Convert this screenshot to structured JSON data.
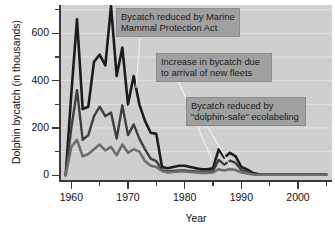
{
  "chart_data": {
    "type": "line",
    "title": "",
    "xlabel": "Year",
    "ylabel": "Dolphin bycatch (in thousands)",
    "xlim": [
      1958,
      2006
    ],
    "ylim": [
      -20,
      720
    ],
    "yticks": [
      0,
      200,
      400,
      600
    ],
    "yticklabels": [
      "0",
      "200",
      "400",
      "600"
    ],
    "y_minor_ticks": [
      100,
      300,
      500,
      700
    ],
    "xticks": [
      1960,
      1970,
      1980,
      1990,
      2000
    ],
    "xticklabels": [
      "1960",
      "1970",
      "1980",
      "1990",
      "2000"
    ],
    "x_minor_ticks": [
      1965,
      1975,
      1985,
      1995,
      2005
    ],
    "grid": "horizontal",
    "legend": "none",
    "plot_background": "#cfcfcf",
    "gridline_color": "#e2e2e2",
    "x": [
      1959,
      1960,
      1961,
      1962,
      1963,
      1964,
      1965,
      1966,
      1967,
      1968,
      1969,
      1970,
      1971,
      1972,
      1973,
      1974,
      1975,
      1976,
      1977,
      1978,
      1979,
      1980,
      1981,
      1982,
      1983,
      1984,
      1985,
      1986,
      1987,
      1988,
      1989,
      1990,
      1991,
      1992,
      1993,
      1994,
      1995,
      1996,
      1997,
      1998,
      1999,
      2000,
      2001,
      2002,
      2003,
      2004,
      2005
    ],
    "series": [
      {
        "name": "total-bycatch",
        "color": "#1c1c1c",
        "width": 2.6,
        "values": [
          0,
          345,
          660,
          280,
          290,
          480,
          510,
          465,
          715,
          420,
          540,
          300,
          420,
          300,
          230,
          180,
          175,
          35,
          30,
          35,
          40,
          40,
          35,
          30,
          25,
          25,
          30,
          110,
          75,
          95,
          80,
          35,
          25,
          10,
          5,
          3,
          3,
          3,
          3,
          3,
          3,
          3,
          3,
          3,
          3,
          3,
          3
        ]
      },
      {
        "name": "secondary-fleet-bycatch",
        "color": "#3f3f3f",
        "width": 2.4,
        "values": [
          0,
          200,
          360,
          150,
          170,
          250,
          290,
          250,
          265,
          155,
          295,
          170,
          215,
          155,
          110,
          70,
          60,
          22,
          16,
          18,
          20,
          20,
          18,
          16,
          14,
          14,
          18,
          65,
          45,
          62,
          52,
          22,
          14,
          5,
          2,
          2,
          2,
          2,
          2,
          2,
          2,
          2,
          2,
          2,
          2,
          2,
          2
        ]
      },
      {
        "name": "ecolabeling-affected-bycatch",
        "color": "#6e6e6e",
        "width": 2.6,
        "values": [
          0,
          120,
          150,
          80,
          90,
          110,
          130,
          105,
          120,
          85,
          130,
          95,
          110,
          100,
          60,
          40,
          35,
          18,
          12,
          14,
          16,
          16,
          14,
          12,
          10,
          10,
          12,
          25,
          20,
          26,
          22,
          12,
          8,
          3,
          2,
          2,
          2,
          2,
          2,
          2,
          2,
          2,
          2,
          2,
          2,
          2,
          2
        ]
      }
    ],
    "annotations": [
      {
        "id": "mmpa",
        "text": "Bycatch reduced by Marine\nMammal Protection Act",
        "leader_from": [
          140,
          38
        ],
        "leader_to": [
          136,
          88
        ]
      },
      {
        "id": "fleets",
        "text": "Increase in bycatch due\nto arrival of new fleets",
        "leader_from": [
          178,
          80
        ],
        "leader_to": [
          212,
          160
        ]
      },
      {
        "id": "ecolabel",
        "text": "Bycatch reduced by\n\"dolphin-safe\" ecolabeling",
        "leader_from": [
          206,
          124
        ],
        "leader_to": [
          231,
          167
        ]
      }
    ]
  },
  "axis": {
    "y_title": "Dolphin bycatch (in thousands)",
    "x_title": "Year"
  }
}
